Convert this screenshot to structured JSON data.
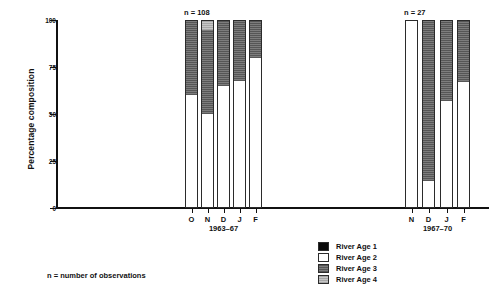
{
  "chart_data": {
    "type": "bar",
    "subtype": "stacked-percentage",
    "title": "",
    "xlabel": "",
    "ylabel": "Percentage composition",
    "ylim": [
      0,
      100
    ],
    "yticks": [
      0,
      25,
      50,
      75,
      100
    ],
    "ytick_labels": [
      "0",
      "25",
      "50",
      "75",
      "100"
    ],
    "grid": false,
    "legend_position": "bottom-center",
    "series": [
      {
        "name": "River Age 1",
        "color": "#0a0a0a",
        "values": [
          0,
          0,
          0,
          0,
          0,
          0,
          0,
          0,
          0
        ]
      },
      {
        "name": "River Age 2",
        "color": "#ffffff",
        "values": [
          60,
          50,
          65,
          68,
          80,
          100,
          14,
          57,
          67
        ]
      },
      {
        "name": "River Age 3",
        "color": "#6e6e6e",
        "values": [
          40,
          45,
          35,
          32,
          20,
          0,
          86,
          43,
          33
        ]
      },
      {
        "name": "River Age 4",
        "color": "#bdbdbd",
        "values": [
          0,
          5,
          0,
          0,
          0,
          0,
          0,
          0,
          0
        ]
      }
    ],
    "categories": [
      "O",
      "N",
      "D",
      "J",
      "F",
      "N",
      "D",
      "J",
      "F"
    ],
    "groups": [
      {
        "label": "1963–67",
        "n_label": "n = 108",
        "categories": [
          "O",
          "N",
          "D",
          "J",
          "F"
        ],
        "bars": [
          {
            "category": "O",
            "segments": [
              {
                "series": "River Age 2",
                "value": 60
              },
              {
                "series": "River Age 3",
                "value": 40
              }
            ]
          },
          {
            "category": "N",
            "segments": [
              {
                "series": "River Age 2",
                "value": 50
              },
              {
                "series": "River Age 3",
                "value": 45
              },
              {
                "series": "River Age 4",
                "value": 5
              }
            ]
          },
          {
            "category": "D",
            "segments": [
              {
                "series": "River Age 2",
                "value": 65
              },
              {
                "series": "River Age 3",
                "value": 35
              }
            ]
          },
          {
            "category": "J",
            "segments": [
              {
                "series": "River Age 2",
                "value": 68
              },
              {
                "series": "River Age 3",
                "value": 32
              }
            ]
          },
          {
            "category": "F",
            "segments": [
              {
                "series": "River Age 2",
                "value": 80
              },
              {
                "series": "River Age 3",
                "value": 20
              }
            ]
          }
        ]
      },
      {
        "label": "1967–70",
        "n_label": "n = 27",
        "categories": [
          "N",
          "D",
          "J",
          "F"
        ],
        "bars": [
          {
            "category": "N",
            "segments": [
              {
                "series": "River Age 2",
                "value": 100
              }
            ]
          },
          {
            "category": "D",
            "segments": [
              {
                "series": "River Age 2",
                "value": 14
              },
              {
                "series": "River Age 3",
                "value": 86
              }
            ]
          },
          {
            "category": "J",
            "segments": [
              {
                "series": "River Age 2",
                "value": 57
              },
              {
                "series": "River Age 3",
                "value": 43
              }
            ]
          },
          {
            "category": "F",
            "segments": [
              {
                "series": "River Age 2",
                "value": 67
              },
              {
                "series": "River Age 3",
                "value": 33
              }
            ]
          }
        ]
      }
    ],
    "legend": [
      {
        "label": "River Age 1",
        "swatch": "age1"
      },
      {
        "label": "River Age 2",
        "swatch": "age2"
      },
      {
        "label": "River Age 3",
        "swatch": "age3"
      },
      {
        "label": "River Age 4",
        "swatch": "age4"
      }
    ],
    "footnote": "n = number of observations"
  }
}
